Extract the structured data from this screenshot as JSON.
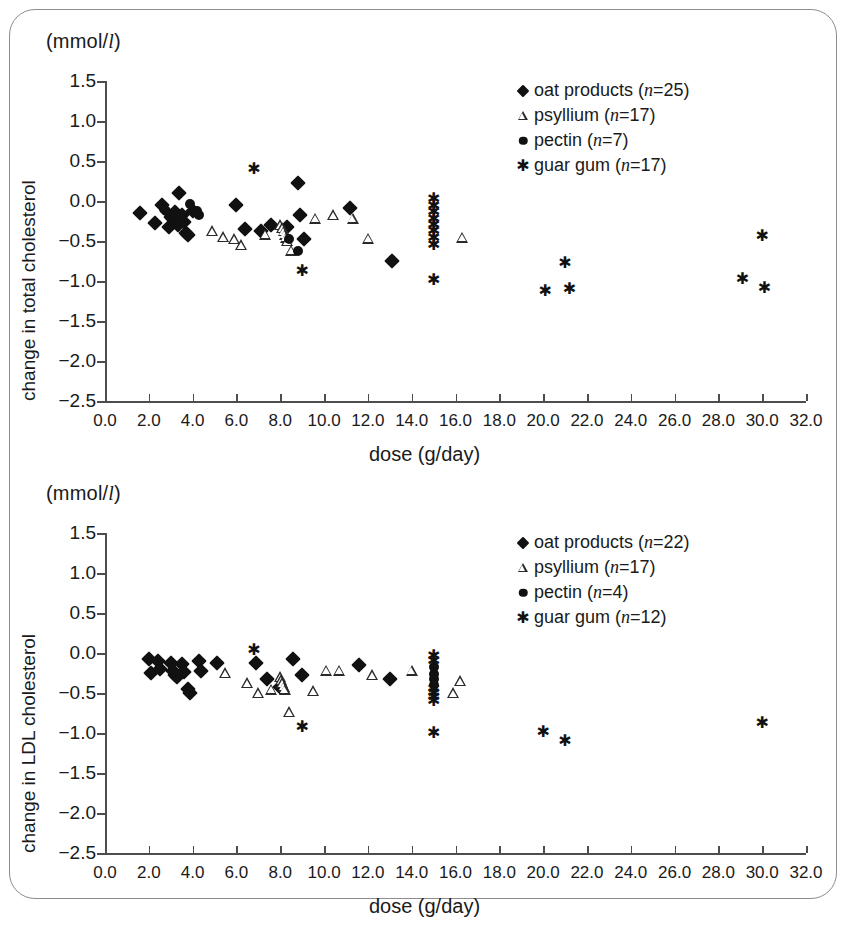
{
  "figure": {
    "unit_label_prefix": "(mmol/",
    "unit_label_italic": "l",
    "unit_label_suffix": ")",
    "x_axis_title": "dose (g/day)",
    "x_ticks": [
      "0.0",
      "2.0",
      "4.0",
      "6.0",
      "8.0",
      "10.0",
      "12.0",
      "14.0",
      "16.0",
      "18.0",
      "20.0",
      "22.0",
      "24.0",
      "26.0",
      "28.0",
      "30.0",
      "32.0"
    ],
    "y_ticks": [
      "1.5",
      "1.0",
      "0.5",
      "0.0",
      "−0.5",
      "−1.0",
      "−1.5",
      "−2.0",
      "−2.5"
    ],
    "frame_color": "#8d8d8d",
    "axis_color": "#4d4d4d",
    "marker_color": "#111111"
  },
  "chart_data": [
    {
      "type": "scatter",
      "title": "",
      "panel_id": "total-cholesterol",
      "xlabel": "dose (g/day)",
      "ylabel": "change in total cholesterol",
      "unit": "(mmol/l)",
      "xlim": [
        0.0,
        32.0
      ],
      "ylim": [
        -2.5,
        1.5
      ],
      "xticks": [
        0,
        2,
        4,
        6,
        8,
        10,
        12,
        14,
        16,
        18,
        20,
        22,
        24,
        26,
        28,
        30,
        32
      ],
      "yticks": [
        1.5,
        1.0,
        0.5,
        0.0,
        -0.5,
        -1.0,
        -1.5,
        -2.0,
        -2.5
      ],
      "grid": false,
      "legend_position": "top-right",
      "series": [
        {
          "name": "oat products",
          "n": 25,
          "marker": "filled-diamond",
          "points": [
            [
              1.6,
              -0.15
            ],
            [
              2.3,
              -0.28
            ],
            [
              2.6,
              -0.05
            ],
            [
              2.9,
              -0.32
            ],
            [
              3.0,
              -0.2
            ],
            [
              3.1,
              -0.22
            ],
            [
              3.2,
              -0.14
            ],
            [
              3.3,
              -0.25
            ],
            [
              3.35,
              -0.3
            ],
            [
              3.4,
              0.1
            ],
            [
              3.5,
              -0.18
            ],
            [
              3.6,
              -0.26
            ],
            [
              3.7,
              -0.4
            ],
            [
              3.8,
              -0.43
            ],
            [
              4.0,
              -0.12
            ],
            [
              6.0,
              -0.05
            ],
            [
              6.4,
              -0.35
            ],
            [
              7.1,
              -0.38
            ],
            [
              7.6,
              -0.3
            ],
            [
              8.3,
              -0.32
            ],
            [
              8.8,
              0.22
            ],
            [
              8.9,
              -0.18
            ],
            [
              9.1,
              -0.47
            ],
            [
              11.2,
              -0.09
            ],
            [
              13.1,
              -0.75
            ]
          ]
        },
        {
          "name": "psyllium",
          "n": 17,
          "marker": "open-triangle",
          "points": [
            [
              4.9,
              -0.38
            ],
            [
              5.4,
              -0.45
            ],
            [
              5.9,
              -0.48
            ],
            [
              6.2,
              -0.55
            ],
            [
              7.3,
              -0.42
            ],
            [
              8.0,
              -0.3
            ],
            [
              8.1,
              -0.34
            ],
            [
              8.15,
              -0.38
            ],
            [
              8.2,
              -0.42
            ],
            [
              8.25,
              -0.46
            ],
            [
              8.3,
              -0.5
            ],
            [
              8.5,
              -0.62
            ],
            [
              9.6,
              -0.22
            ],
            [
              10.4,
              -0.18
            ],
            [
              11.3,
              -0.22
            ],
            [
              12.0,
              -0.47
            ],
            [
              16.3,
              -0.46
            ]
          ]
        },
        {
          "name": "pectin",
          "n": 7,
          "marker": "filled-circle",
          "points": [
            [
              2.7,
              -0.1
            ],
            [
              2.8,
              -0.12
            ],
            [
              3.9,
              -0.04
            ],
            [
              4.2,
              -0.12
            ],
            [
              4.3,
              -0.18
            ],
            [
              8.4,
              -0.48
            ],
            [
              8.8,
              -0.62
            ]
          ]
        },
        {
          "name": "guar gum",
          "n": 17,
          "marker": "asterisk",
          "points": [
            [
              6.8,
              0.4
            ],
            [
              9.0,
              -0.87
            ],
            [
              15.0,
              0.02
            ],
            [
              15.0,
              -0.06
            ],
            [
              15.0,
              -0.14
            ],
            [
              15.0,
              -0.22
            ],
            [
              15.0,
              -0.3
            ],
            [
              15.0,
              -0.38
            ],
            [
              15.0,
              -0.46
            ],
            [
              15.0,
              -0.99
            ],
            [
              20.1,
              -1.13
            ],
            [
              21.0,
              -0.78
            ],
            [
              21.2,
              -1.1
            ],
            [
              29.1,
              -0.97
            ],
            [
              30.0,
              -0.44
            ],
            [
              30.1,
              -1.09
            ],
            [
              15.0,
              -0.55
            ]
          ]
        }
      ]
    },
    {
      "type": "scatter",
      "title": "",
      "panel_id": "ldl-cholesterol",
      "xlabel": "dose (g/day)",
      "ylabel": "change in LDL cholesterol",
      "unit": "(mmol/l)",
      "xlim": [
        0.0,
        32.0
      ],
      "ylim": [
        -2.5,
        1.5
      ],
      "xticks": [
        0,
        2,
        4,
        6,
        8,
        10,
        12,
        14,
        16,
        18,
        20,
        22,
        24,
        26,
        28,
        30,
        32
      ],
      "yticks": [
        1.5,
        1.0,
        0.5,
        0.0,
        -0.5,
        -1.0,
        -1.5,
        -2.0,
        -2.5
      ],
      "grid": false,
      "legend_position": "top-right",
      "series": [
        {
          "name": "oat products",
          "n": 22,
          "marker": "filled-diamond",
          "points": [
            [
              2.0,
              -0.08
            ],
            [
              2.1,
              -0.25
            ],
            [
              2.4,
              -0.1
            ],
            [
              2.5,
              -0.2
            ],
            [
              3.0,
              -0.12
            ],
            [
              3.1,
              -0.22
            ],
            [
              3.2,
              -0.27
            ],
            [
              3.3,
              -0.3
            ],
            [
              3.5,
              -0.14
            ],
            [
              3.6,
              -0.24
            ],
            [
              3.8,
              -0.45
            ],
            [
              3.9,
              -0.5
            ],
            [
              4.3,
              -0.1
            ],
            [
              4.4,
              -0.22
            ],
            [
              5.1,
              -0.12
            ],
            [
              6.9,
              -0.12
            ],
            [
              7.4,
              -0.32
            ],
            [
              8.0,
              -0.42
            ],
            [
              8.6,
              -0.08
            ],
            [
              9.0,
              -0.27
            ],
            [
              11.6,
              -0.15
            ],
            [
              13.0,
              -0.33
            ]
          ]
        },
        {
          "name": "psyllium",
          "n": 17,
          "marker": "open-triangle",
          "points": [
            [
              5.5,
              -0.25
            ],
            [
              6.5,
              -0.38
            ],
            [
              7.0,
              -0.5
            ],
            [
              7.6,
              -0.46
            ],
            [
              8.0,
              -0.3
            ],
            [
              8.05,
              -0.34
            ],
            [
              8.1,
              -0.38
            ],
            [
              8.15,
              -0.42
            ],
            [
              8.2,
              -0.46
            ],
            [
              8.4,
              -0.74
            ],
            [
              9.5,
              -0.48
            ],
            [
              10.1,
              -0.22
            ],
            [
              10.7,
              -0.22
            ],
            [
              12.2,
              -0.28
            ],
            [
              14.0,
              -0.22
            ],
            [
              16.2,
              -0.35
            ],
            [
              15.9,
              -0.5
            ]
          ]
        },
        {
          "name": "pectin",
          "n": 4,
          "marker": "filled-circle",
          "points": [
            [
              15.0,
              -0.18
            ],
            [
              15.0,
              -0.26
            ],
            [
              15.0,
              -0.33
            ],
            [
              15.0,
              -0.4
            ]
          ]
        },
        {
          "name": "guar gum",
          "n": 12,
          "marker": "asterisk",
          "points": [
            [
              6.8,
              0.04
            ],
            [
              9.0,
              -0.93
            ],
            [
              15.0,
              -0.04
            ],
            [
              15.0,
              -0.1
            ],
            [
              15.0,
              -1.0
            ],
            [
              20.0,
              -0.99
            ],
            [
              21.0,
              -1.1
            ],
            [
              30.0,
              -0.88
            ],
            [
              15.0,
              -0.45
            ],
            [
              15.0,
              -0.5
            ],
            [
              15.0,
              -0.55
            ],
            [
              15.0,
              -0.6
            ]
          ]
        }
      ]
    }
  ],
  "panels": [
    {
      "id": "total-cholesterol",
      "y_axis_title": "change in total cholesterol",
      "legend": [
        {
          "symbol": "filled-diamond",
          "label_prefix": "oat products (",
          "italic": "n",
          "label_suffix": "=25)"
        },
        {
          "symbol": "open-triangle",
          "label_prefix": "psyllium (",
          "italic": "n",
          "label_suffix": "=17)"
        },
        {
          "symbol": "filled-circle",
          "label_prefix": "pectin (",
          "italic": "n",
          "label_suffix": "=7)"
        },
        {
          "symbol": "asterisk",
          "label_prefix": "guar gum (",
          "italic": "n",
          "label_suffix": "=17)"
        }
      ]
    },
    {
      "id": "ldl-cholesterol",
      "y_axis_title": "change in LDL cholesterol",
      "legend": [
        {
          "symbol": "filled-diamond",
          "label_prefix": "oat products (",
          "italic": "n",
          "label_suffix": "=22)"
        },
        {
          "symbol": "open-triangle",
          "label_prefix": "psyllium (",
          "italic": "n",
          "label_suffix": "=17)"
        },
        {
          "symbol": "filled-circle",
          "label_prefix": "pectin (",
          "italic": "n",
          "label_suffix": "=4)"
        },
        {
          "symbol": "asterisk",
          "label_prefix": "guar gum (",
          "italic": "n",
          "label_suffix": "=12)"
        }
      ]
    }
  ]
}
